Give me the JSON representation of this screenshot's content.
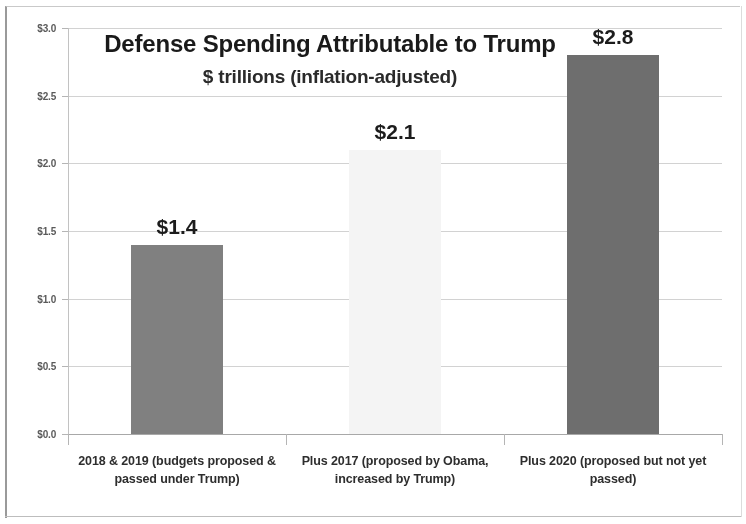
{
  "chart_data": {
    "type": "bar",
    "title": "Defense Spending Attributable to Trump",
    "subtitle": "$ trillions (inflation-adjusted)",
    "xlabel": "",
    "ylabel": "",
    "ylim": [
      0,
      3.0
    ],
    "ytick_step": 0.5,
    "grid": true,
    "legend": "none",
    "categories": [
      "2018 & 2019 (budgets proposed & passed under Trump)",
      "Plus 2017 (proposed by Obama, increased by Trump)",
      "Plus 2020 (proposed but not yet passed)"
    ],
    "values": [
      1.4,
      2.1,
      2.8
    ],
    "data_labels": [
      "$1.4",
      "$2.1",
      "$2.8"
    ],
    "ytick_labels": [
      "$3.0",
      "$2.5",
      "$2.0",
      "$1.5",
      "$1.0",
      "$0.5",
      "$0.0"
    ],
    "ytick_values": [
      3.0,
      2.5,
      2.0,
      1.5,
      1.0,
      0.5,
      0.0
    ],
    "bar_colors": [
      "#808080",
      "#f4f4f4",
      "#6e6e6e"
    ]
  }
}
